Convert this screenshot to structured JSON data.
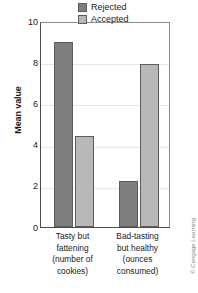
{
  "chart_data": {
    "type": "bar",
    "title": "",
    "xlabel": "",
    "ylabel": "Mean value",
    "ylim": [
      0,
      10
    ],
    "yticks": [
      10,
      8,
      6,
      4,
      2,
      0
    ],
    "grid": true,
    "legend_position": "top-right",
    "categories": [
      "Tasty but fattening (number of cookies)",
      "Bad-tasting but healthy (ounces consumed)"
    ],
    "category_lines": [
      [
        "Tasty but",
        "fattening",
        "(number of",
        "cookies)"
      ],
      [
        "Bad-tasting",
        "but healthy",
        "(ounces",
        "consumed)"
      ]
    ],
    "series": [
      {
        "name": "Rejected",
        "color": "#7f7f7f",
        "values": [
          9.0,
          2.25
        ]
      },
      {
        "name": "Accepted",
        "color": "#b8b8b8",
        "values": [
          4.4,
          7.9
        ]
      }
    ]
  },
  "legend": {
    "items": [
      {
        "label": "Rejected",
        "color": "#7f7f7f"
      },
      {
        "label": "Accepted",
        "color": "#b8b8b8"
      }
    ]
  },
  "credit": {
    "text": "© Cengage Learning"
  },
  "colors": {
    "rejected": "#7f7f7f",
    "accepted": "#b8b8b8",
    "axis": "#4d4d4d",
    "grid": "#e6e6e6",
    "text": "#1a1a1a"
  }
}
